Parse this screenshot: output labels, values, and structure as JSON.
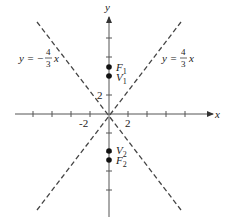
{
  "diagram": {
    "type": "hyperbola-asymptotes",
    "axes": {
      "x_label": "x",
      "y_label": "y",
      "x_tick_labels": [
        "-2",
        "2"
      ],
      "y_tick_labels": [
        "2"
      ]
    },
    "asymptotes": [
      {
        "name": "positive",
        "equation_prefix": "y = ",
        "frac_num": "4",
        "frac_den": "3",
        "suffix": "x"
      },
      {
        "name": "negative",
        "equation_prefix": "y = −",
        "frac_num": "4",
        "frac_den": "3",
        "suffix": "x"
      }
    ],
    "points": [
      {
        "name": "F1",
        "letter": "F",
        "sub": "1"
      },
      {
        "name": "V1",
        "letter": "V",
        "sub": "1"
      },
      {
        "name": "V2",
        "letter": "V",
        "sub": "2"
      },
      {
        "name": "F2",
        "letter": "F",
        "sub": "2"
      }
    ],
    "colors": {
      "axis": "#555555",
      "line": "#444444",
      "point": "#111111"
    }
  }
}
